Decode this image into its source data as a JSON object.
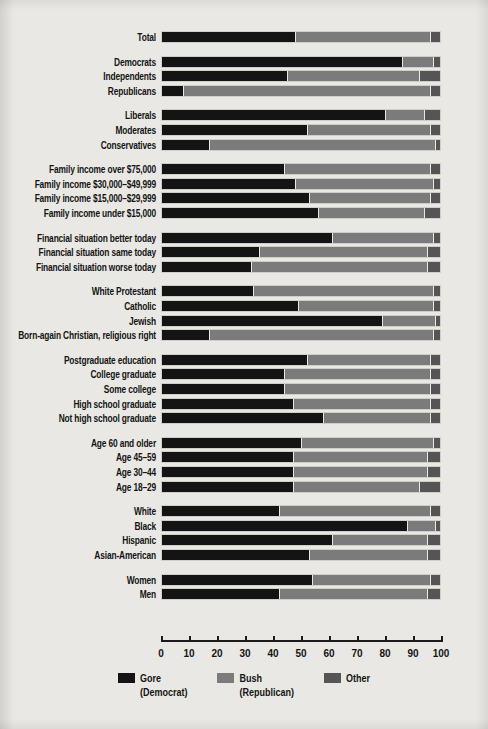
{
  "chart_data": {
    "type": "bar",
    "orientation": "horizontal",
    "stacked": true,
    "title": "",
    "xlabel": "",
    "ylabel": "",
    "xlim": [
      0,
      100
    ],
    "grid": false,
    "legend_position": "bottom-center",
    "axis": {
      "ticks": [
        0,
        10,
        20,
        30,
        40,
        50,
        60,
        70,
        80,
        90,
        100
      ],
      "tick_labels": [
        "0",
        "10",
        "20",
        "30",
        "40",
        "50",
        "60",
        "70",
        "80",
        "90",
        "100"
      ]
    },
    "series": [
      {
        "name": "Gore",
        "sub": "(Democrat)",
        "color": "#141414"
      },
      {
        "name": "Bush",
        "sub": "(Republican)",
        "color": "#7b7b7b"
      },
      {
        "name": "Other",
        "sub": "",
        "color": "#555555"
      }
    ],
    "categories": [
      "Total",
      "Democrats",
      "Independents",
      "Republicans",
      "Liberals",
      "Moderates",
      "Conservatives",
      "Family income over $75,000",
      "Family income $30,000–$49,999",
      "Family income $15,000–$29,999",
      "Family income under $15,000",
      "Financial situation better today",
      "Financial situation same today",
      "Financial situation worse today",
      "White Protestant",
      "Catholic",
      "Jewish",
      "Born-again Christian, religious right",
      "Postgraduate education",
      "College graduate",
      "Some college",
      "High school graduate",
      "Not high school graduate",
      "Age 60 and older",
      "Age 45–59",
      "Age 30–44",
      "Age 18–29",
      "White",
      "Black",
      "Hispanic",
      "Asian-American",
      "Women",
      "Men"
    ],
    "values": {
      "Gore": [
        48,
        86,
        45,
        8,
        80,
        52,
        17,
        44,
        48,
        53,
        56,
        61,
        35,
        32,
        33,
        49,
        79,
        17,
        52,
        44,
        44,
        47,
        58,
        50,
        47,
        47,
        47,
        42,
        88,
        61,
        53,
        54,
        42
      ],
      "Bush": [
        48,
        11,
        47,
        88,
        14,
        44,
        81,
        52,
        49,
        43,
        38,
        36,
        60,
        63,
        64,
        48,
        19,
        80,
        44,
        52,
        52,
        49,
        38,
        47,
        48,
        48,
        45,
        54,
        10,
        34,
        42,
        42,
        53
      ],
      "Other": [
        4,
        3,
        8,
        4,
        6,
        4,
        2,
        4,
        3,
        4,
        6,
        3,
        5,
        5,
        3,
        3,
        2,
        3,
        4,
        4,
        4,
        4,
        4,
        3,
        5,
        5,
        8,
        4,
        2,
        5,
        5,
        4,
        5
      ]
    },
    "group_breaks_after": [
      0,
      3,
      6,
      10,
      13,
      17,
      22,
      26,
      30
    ]
  }
}
